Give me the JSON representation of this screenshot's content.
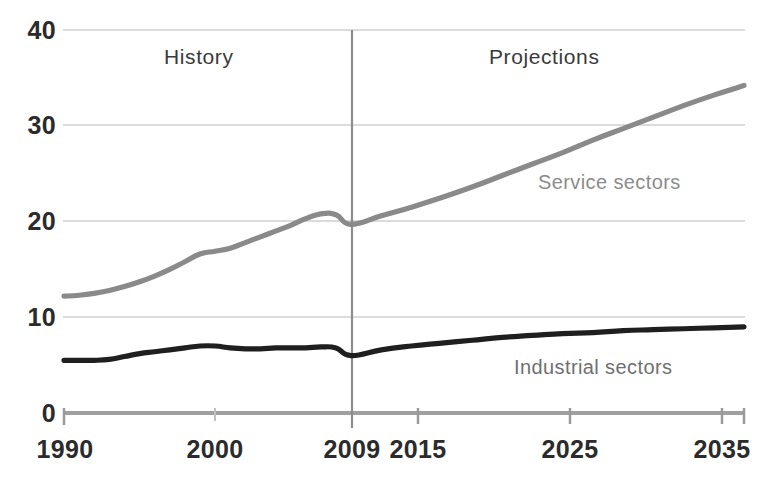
{
  "chart_data": {
    "type": "line",
    "title": "",
    "subtitle": "",
    "xlabel": "",
    "ylabel": "",
    "xlim": [
      1990,
      2035
    ],
    "ylim": [
      0,
      40
    ],
    "y_ticks": [
      0,
      10,
      20,
      30,
      40
    ],
    "x_ticks": [
      1990,
      2000,
      2009,
      2015,
      2025,
      2035
    ],
    "x_tick_labels": [
      "1990",
      "2000",
      "2009",
      "2015",
      "2025",
      "2035"
    ],
    "y_tick_labels": [
      "0",
      "10",
      "20",
      "30",
      "40"
    ],
    "grid": true,
    "grid_axis": "y",
    "legend": "inline-annotations",
    "annotations": [
      {
        "text": "History",
        "x": 1998,
        "y": 38.0,
        "name": "history-label"
      },
      {
        "text": "Projections",
        "x": 2018,
        "y": 38.0,
        "name": "projections-label"
      },
      {
        "text": "Service sectors",
        "x": 2024,
        "y": 21.5,
        "name": "service-sectors-label"
      },
      {
        "text": "Industrial sectors",
        "x": 2023,
        "y": 7.2,
        "name": "industrial-sectors-label"
      }
    ],
    "divider": {
      "x": 2009,
      "label": "2009",
      "name": "history-projection-divider"
    },
    "colors": {
      "service": "#8a8a8a",
      "industrial": "#1f1f1f",
      "grid": "#cfcfcf",
      "axis": "#a8a8a8",
      "divider": "#8c8c8c",
      "text": "#2b2b2b"
    },
    "series": [
      {
        "name": "Service sectors",
        "color": "#8a8a8a",
        "x": [
          1990,
          1991,
          1992,
          1993,
          1994,
          1995,
          1996,
          1997,
          1998,
          1999,
          2000,
          2001,
          2002,
          2003,
          2004,
          2005,
          2006,
          2007,
          2008,
          2009,
          2011,
          2013,
          2015,
          2017,
          2019,
          2021,
          2023,
          2025,
          2027,
          2029,
          2031,
          2033,
          2035
        ],
        "values": [
          12.2,
          12.3,
          12.5,
          12.8,
          13.2,
          13.7,
          14.3,
          15.0,
          15.8,
          16.6,
          16.9,
          17.2,
          17.8,
          18.4,
          19.0,
          19.6,
          20.3,
          20.8,
          20.7,
          19.7,
          20.6,
          21.5,
          22.5,
          23.6,
          24.8,
          26.0,
          27.2,
          28.5,
          29.7,
          30.9,
          32.1,
          33.2,
          34.2
        ]
      },
      {
        "name": "Industrial sectors",
        "color": "#1f1f1f",
        "x": [
          1990,
          1991,
          1992,
          1993,
          1994,
          1995,
          1996,
          1997,
          1998,
          1999,
          2000,
          2001,
          2002,
          2003,
          2004,
          2005,
          2006,
          2007,
          2008,
          2009,
          2011,
          2013,
          2015,
          2017,
          2019,
          2021,
          2023,
          2025,
          2027,
          2029,
          2031,
          2033,
          2035
        ],
        "values": [
          5.5,
          5.5,
          5.5,
          5.6,
          5.9,
          6.2,
          6.4,
          6.6,
          6.8,
          7.0,
          7.0,
          6.8,
          6.7,
          6.7,
          6.8,
          6.8,
          6.8,
          6.9,
          6.8,
          6.0,
          6.6,
          7.0,
          7.3,
          7.6,
          7.9,
          8.1,
          8.3,
          8.4,
          8.6,
          8.7,
          8.8,
          8.9,
          9.0
        ]
      }
    ]
  },
  "axis": {
    "y_labels": [
      "40",
      "30",
      "20",
      "10",
      "0"
    ],
    "x_labels": [
      "1990",
      "2000",
      "2009",
      "2015",
      "2025",
      "2035"
    ]
  },
  "labels": {
    "history": "History",
    "projections": "Projections",
    "service_sectors": "Service sectors",
    "industrial_sectors": "Industrial sectors"
  }
}
